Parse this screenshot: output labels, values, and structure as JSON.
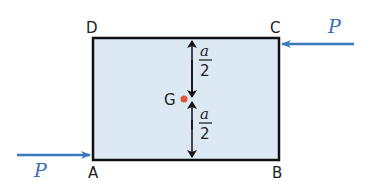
{
  "diagram": {
    "vertices": {
      "A": "A",
      "B": "B",
      "C": "C",
      "D": "D"
    },
    "centroid_label": "G",
    "force_left_label": "P",
    "force_right_label": "P",
    "upper_dim": {
      "numerator": "a",
      "denominator": "2"
    },
    "lower_dim": {
      "numerator": "a",
      "denominator": "2"
    },
    "colors": {
      "plate_fill": "#dde8f5",
      "plate_stroke": "#111111",
      "force_arrow": "#3a78c2",
      "centroid_dot": "#e0533d"
    }
  }
}
